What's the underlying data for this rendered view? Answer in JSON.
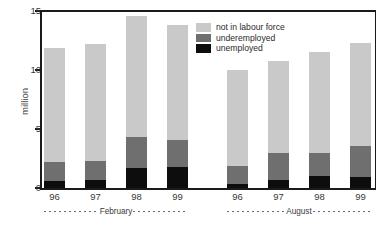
{
  "chart_data": {
    "type": "bar",
    "subtype": "stacked-grouped",
    "title": "",
    "xlabel": "",
    "ylabel": "million",
    "ylim": [
      0,
      15
    ],
    "yticks": [
      0,
      5,
      10,
      15
    ],
    "ytick_labels": [
      "0",
      "5",
      "10",
      "15"
    ],
    "grid": false,
    "legend_position": "top-right",
    "categories": [
      "96",
      "97",
      "98",
      "99",
      "96",
      "97",
      "98",
      "99"
    ],
    "groups": [
      {
        "label": "February",
        "categories": [
          "96",
          "97",
          "98",
          "99"
        ]
      },
      {
        "label": "August",
        "categories": [
          "96",
          "97",
          "98",
          "99"
        ]
      }
    ],
    "series": [
      {
        "name": "unemployed",
        "color": "#0d0d0d",
        "values": [
          0.6,
          0.7,
          1.7,
          1.8,
          0.3,
          0.7,
          1.0,
          0.9
        ]
      },
      {
        "name": "underemployed",
        "color": "#6f6f6f",
        "values": [
          1.6,
          1.6,
          2.6,
          2.3,
          1.6,
          2.3,
          2.0,
          2.7
        ]
      },
      {
        "name": "not in labour force",
        "color": "#c9c9c9",
        "values": [
          9.7,
          9.9,
          10.3,
          9.7,
          8.1,
          7.8,
          8.5,
          8.7
        ]
      }
    ],
    "totals": [
      11.9,
      12.2,
      14.6,
      13.8,
      10.0,
      10.8,
      11.5,
      12.3
    ],
    "cumulative_tops": {
      "unemployed": [
        0.6,
        0.7,
        1.7,
        1.8,
        0.3,
        0.7,
        1.0,
        0.9
      ],
      "underemployed": [
        2.2,
        2.3,
        4.3,
        4.1,
        1.9,
        3.0,
        3.0,
        3.6
      ],
      "not_in_labour_force": [
        11.9,
        12.2,
        14.6,
        13.8,
        10.0,
        10.8,
        11.5,
        12.3
      ]
    }
  },
  "legend": {
    "items": [
      {
        "label": "not in labour force",
        "color": "#c9c9c9"
      },
      {
        "label": "underemployed",
        "color": "#6f6f6f"
      },
      {
        "label": "unemployed",
        "color": "#0d0d0d"
      }
    ]
  },
  "axes": {
    "y": {
      "label": "million",
      "ticks": [
        "15",
        "10",
        "5",
        "0"
      ]
    },
    "x": {
      "tick_labels": [
        "96",
        "97",
        "98",
        "99",
        "96",
        "97",
        "98",
        "99"
      ],
      "group_labels": [
        "February",
        "August"
      ]
    }
  }
}
